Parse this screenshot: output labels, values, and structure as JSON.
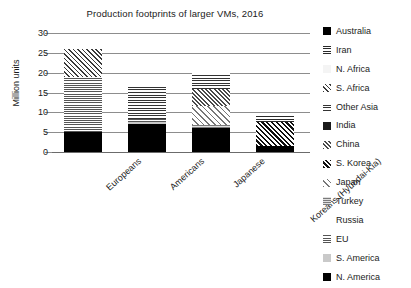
{
  "chart_data": {
    "type": "bar",
    "subtype": "stacked-bar",
    "title": "Production footprints of larger VMs, 2016",
    "xlabel": "",
    "ylabel": "Million units",
    "ylim": [
      0,
      30
    ],
    "yticks": [
      0,
      5,
      10,
      15,
      20,
      25,
      30
    ],
    "grid": true,
    "legend_position": "right",
    "categories": [
      "Europeans",
      "Americans",
      "Japanese",
      "Koreans (Hyundai-Kia)"
    ],
    "stack_order_bottom_to_top": [
      "N. America",
      "S. America",
      "EU",
      "Russia",
      "Turkey",
      "Japan",
      "S. Korea",
      "China",
      "India",
      "Other Asia",
      "S. Africa",
      "N. Africa",
      "Iran",
      "Australia"
    ],
    "series": [
      {
        "name": "N. America",
        "pattern": "solid-black",
        "values": [
          5.0,
          7.0,
          6.0,
          1.5
        ]
      },
      {
        "name": "S. America",
        "pattern": "solid-light-gray",
        "values": [
          0.0,
          0.6,
          0.0,
          0.0
        ]
      },
      {
        "name": "EU",
        "pattern": "horizontal-lines",
        "values": [
          14.0,
          0.8,
          0.0,
          0.0
        ]
      },
      {
        "name": "Russia",
        "pattern": "blank-white",
        "values": [
          0.0,
          0.0,
          0.0,
          0.0
        ]
      },
      {
        "name": "Turkey",
        "pattern": "fine-gray-grid",
        "values": [
          0.0,
          0.0,
          0.7,
          0.0
        ]
      },
      {
        "name": "Japan",
        "pattern": "diagonal-lines",
        "values": [
          0.0,
          0.0,
          5.0,
          0.0
        ]
      },
      {
        "name": "S. Korea",
        "pattern": "dense-crosshatch",
        "values": [
          0.0,
          0.0,
          0.0,
          6.0
        ]
      },
      {
        "name": "China",
        "pattern": "fine-crosshatch",
        "values": [
          0.0,
          0.0,
          4.3,
          0.0
        ]
      },
      {
        "name": "India",
        "pattern": "solid-dark",
        "values": [
          0.0,
          0.0,
          0.0,
          0.0
        ]
      },
      {
        "name": "Other Asia",
        "pattern": "square-grid",
        "values": [
          0.0,
          8.1,
          4.0,
          0.0
        ]
      },
      {
        "name": "S. Africa",
        "pattern": "checker-gray",
        "values": [
          7.0,
          0.0,
          0.0,
          0.0
        ]
      },
      {
        "name": "N. Africa",
        "pattern": "blank-very-light",
        "values": [
          0.0,
          0.0,
          0.0,
          0.0
        ]
      },
      {
        "name": "Iran",
        "pattern": "dark-square-grid",
        "values": [
          0.0,
          0.0,
          0.0,
          1.5
        ]
      },
      {
        "name": "Australia",
        "pattern": "solid-black",
        "values": [
          0.0,
          0.0,
          0.0,
          0.0
        ]
      }
    ],
    "totals": [
      26.0,
      16.5,
      20.0,
      9.0
    ]
  },
  "legend": {
    "items": [
      {
        "label": "Australia",
        "swatch": "solid-black"
      },
      {
        "label": "Iran",
        "swatch": "dark-square-grid"
      },
      {
        "label": "N. Africa",
        "swatch": "blank-very-light"
      },
      {
        "label": "S. Africa",
        "swatch": "checker-gray"
      },
      {
        "label": "Other Asia",
        "swatch": "square-grid"
      },
      {
        "label": "India",
        "swatch": "solid-dark"
      },
      {
        "label": "China",
        "swatch": "fine-crosshatch"
      },
      {
        "label": "S. Korea",
        "swatch": "dense-crosshatch"
      },
      {
        "label": "Japan",
        "swatch": "diagonal-lines"
      },
      {
        "label": "Turkey",
        "swatch": "fine-gray-grid"
      },
      {
        "label": "Russia",
        "swatch": "blank-white"
      },
      {
        "label": "EU",
        "swatch": "horizontal-lines"
      },
      {
        "label": "S. America",
        "swatch": "solid-light-gray"
      },
      {
        "label": "N. America",
        "swatch": "solid-black"
      }
    ]
  }
}
